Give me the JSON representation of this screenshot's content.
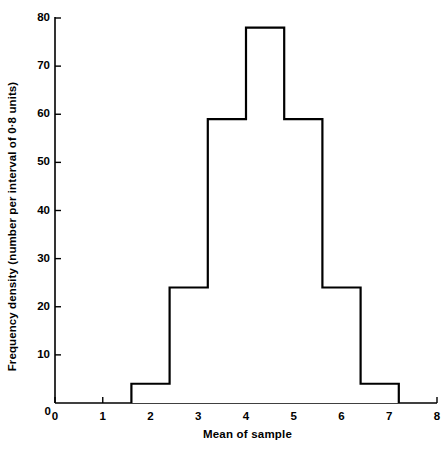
{
  "chart_data": {
    "type": "bar",
    "title": "",
    "xlabel": "Mean of sample",
    "ylabel": "Frequency density (number per interval of 0·8 units)",
    "xlim": [
      0,
      8
    ],
    "ylim": [
      0,
      80
    ],
    "grid": false,
    "legend": null,
    "bin_width": 0.8,
    "bin_edges": [
      1.6,
      2.4,
      3.2,
      4.0,
      4.8,
      5.6,
      6.4,
      7.2
    ],
    "categories": [
      "1.6–2.4",
      "2.4–3.2",
      "3.2–4.0",
      "4.0–4.8",
      "4.8–5.6",
      "5.6–6.4",
      "6.4–7.2"
    ],
    "values": [
      4,
      24,
      59,
      78,
      59,
      24,
      4
    ],
    "xticks": [
      0,
      1,
      2,
      3,
      4,
      5,
      6,
      7,
      8
    ],
    "xtick_labels": [
      "0",
      "1",
      "2",
      "3",
      "4",
      "5",
      "6",
      "7",
      "8"
    ],
    "yticks": [
      0,
      10,
      20,
      30,
      40,
      50,
      60,
      70,
      80
    ],
    "ytick_labels": [
      "0",
      "10",
      "20",
      "30",
      "40",
      "50",
      "60",
      "70",
      "80"
    ],
    "line_color": "#000000",
    "fill_color": "#ffffff",
    "axis_color": "#000000"
  }
}
